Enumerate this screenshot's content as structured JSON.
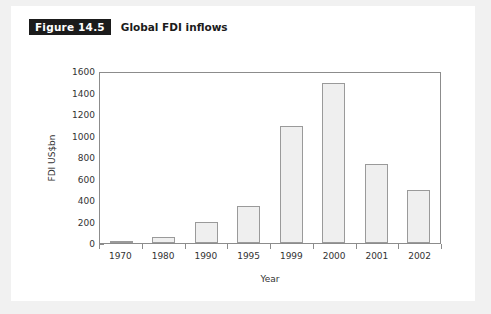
{
  "figure": {
    "badge": "Figure 14.5",
    "caption": "Global FDI inflows"
  },
  "colors": {
    "page_background": "#f1f1f1",
    "card_background": "#ffffff",
    "badge_background": "#1b1b1b",
    "badge_text": "#ffffff",
    "bar_fill": "#efefef",
    "bar_border": "#9a9a9a",
    "axis": "#8c8c8c",
    "text": "#333333"
  },
  "chart_data": {
    "type": "bar",
    "title": "Global FDI inflows",
    "xlabel": "Year",
    "ylabel": "FDI US$bn",
    "categories": [
      "1970",
      "1980",
      "1990",
      "1995",
      "1999",
      "2000",
      "2001",
      "2002"
    ],
    "values": [
      15,
      55,
      200,
      345,
      1090,
      1490,
      735,
      490
    ],
    "ylim": [
      0,
      1600
    ],
    "ytick_labels": [
      "0",
      "200",
      "400",
      "600",
      "800",
      "1000",
      "1200",
      "1400",
      "1600"
    ],
    "ytick_values": [
      0,
      200,
      400,
      600,
      800,
      1000,
      1200,
      1400,
      1600
    ],
    "grid": false,
    "legend": false
  }
}
